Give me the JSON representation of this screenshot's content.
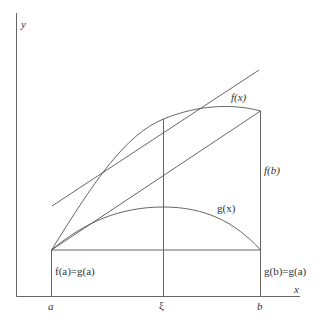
{
  "axes": {
    "x_label": "x",
    "y_label": "y"
  },
  "ticks": {
    "a": "a",
    "xi": "ξ",
    "b": "b"
  },
  "curves": {
    "f_label": "f(x)",
    "g_label": "g(x)"
  },
  "annotations": {
    "fa_eq_ga": "f(a)=g(a)",
    "fb": "f(b)",
    "gb_eq_ga": "g(b)=g(a)"
  },
  "colors": {
    "stroke": "#555555",
    "text": "#333333",
    "background": "#ffffff"
  }
}
